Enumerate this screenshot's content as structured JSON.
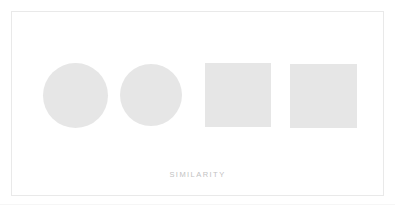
{
  "card": {
    "caption": "SIMILARITY",
    "background_color": "#ffffff",
    "border_color": "#e9e9e9",
    "caption_color": "#c2c2c2"
  },
  "shapes": [
    {
      "name": "circle-1",
      "kind": "circle",
      "fill": "#e6e6e6",
      "left": 31,
      "top": 51,
      "width": 65,
      "height": 65
    },
    {
      "name": "circle-2",
      "kind": "circle",
      "fill": "#e6e6e6",
      "left": 108,
      "top": 52,
      "width": 62,
      "height": 62
    },
    {
      "name": "square-1",
      "kind": "square",
      "fill": "#e6e6e6",
      "left": 193,
      "top": 51,
      "width": 66,
      "height": 64
    },
    {
      "name": "square-2",
      "kind": "square",
      "fill": "#e6e6e6",
      "left": 278,
      "top": 52,
      "width": 67,
      "height": 64
    }
  ],
  "baseline": {
    "color": "#f6f6f6"
  }
}
